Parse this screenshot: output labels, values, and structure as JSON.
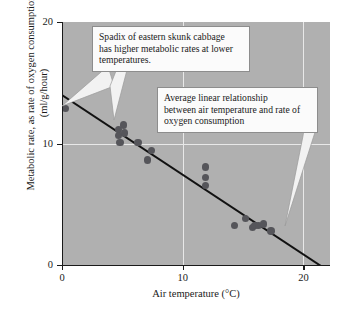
{
  "chart_data": {
    "type": "scatter",
    "title": "",
    "xlabel": "Air temperature (°C)",
    "ylabel": "Metabolic rate, as rate of oxygen consumption (ml/g/hour)",
    "xlim": [
      0,
      22.2
    ],
    "ylim": [
      0,
      20.8
    ],
    "x_ticks": [
      0,
      10,
      20
    ],
    "x_tick_labels": [
      "0",
      "10",
      "20"
    ],
    "y_ticks": [
      0,
      10,
      20
    ],
    "y_tick_labels": [
      "0",
      "10",
      "20"
    ],
    "grid": "white gridlines at x=10 and y=10",
    "legend": "none",
    "point_color": "#55555a",
    "line_color": "#111111",
    "plot_background": "#b0b0b0",
    "series": [
      {
        "name": "Spadix metabolic rate measurements",
        "points": [
          {
            "x": 0.3,
            "y": 13.4
          },
          {
            "x": 4.7,
            "y": 11.6
          },
          {
            "x": 4.7,
            "y": 11.1
          },
          {
            "x": 4.8,
            "y": 10.5
          },
          {
            "x": 5.1,
            "y": 12.0
          },
          {
            "x": 5.2,
            "y": 11.3
          },
          {
            "x": 6.3,
            "y": 10.5
          },
          {
            "x": 7.1,
            "y": 9.0
          },
          {
            "x": 7.4,
            "y": 9.8
          },
          {
            "x": 11.9,
            "y": 8.4
          },
          {
            "x": 11.9,
            "y": 7.5
          },
          {
            "x": 11.9,
            "y": 6.8
          },
          {
            "x": 14.3,
            "y": 3.4
          },
          {
            "x": 15.2,
            "y": 4.0
          },
          {
            "x": 15.8,
            "y": 3.2
          },
          {
            "x": 16.0,
            "y": 3.4
          },
          {
            "x": 16.3,
            "y": 3.4
          },
          {
            "x": 16.7,
            "y": 3.5
          },
          {
            "x": 17.3,
            "y": 2.9
          }
        ]
      }
    ],
    "regression_line": {
      "name": "Average linear relationship",
      "x_start": 0.0,
      "y_start": 14.6,
      "x_end": 21.4,
      "y_end": 0.0,
      "slope": -0.68,
      "intercept": 14.6
    },
    "annotations": [
      {
        "id": "callout-spadix",
        "lines": [
          "Spadix of eastern skunk cabbage",
          "has higher metabolic rates at lower",
          "temperatures."
        ],
        "points_to": "data point cluster near 5 °C and the regression line"
      },
      {
        "id": "callout-regression",
        "lines": [
          "Average linear relationship",
          "between air temperature and rate of",
          "oxygen consumption"
        ],
        "points_to": "regression line near 18 °C"
      }
    ]
  }
}
